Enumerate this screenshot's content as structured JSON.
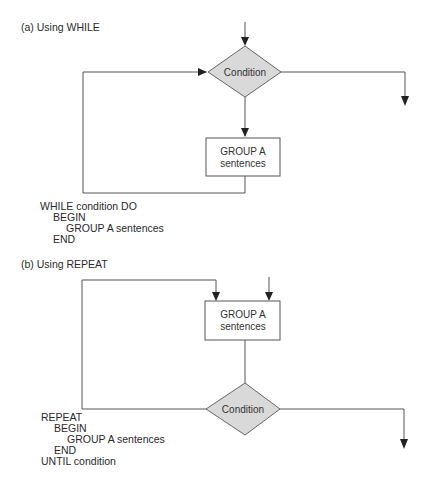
{
  "panel_a": {
    "title": "(a) Using WHILE",
    "condition_label": "Condition",
    "box_line1": "GROUP A",
    "box_line2": "sentences",
    "code": [
      "WHILE condition DO",
      "BEGIN",
      "GROUP A sentences",
      "END"
    ]
  },
  "panel_b": {
    "title": "(b) Using REPEAT",
    "condition_label": "Condition",
    "box_line1": "GROUP A",
    "box_line2": "sentences",
    "code": [
      "REPEAT",
      "BEGIN",
      "GROUP A sentences",
      "END",
      "UNTIL condition"
    ]
  },
  "colors": {
    "diamond_fill": "#d9d9d9",
    "line": "#555555",
    "text": "#2a2a2a"
  }
}
